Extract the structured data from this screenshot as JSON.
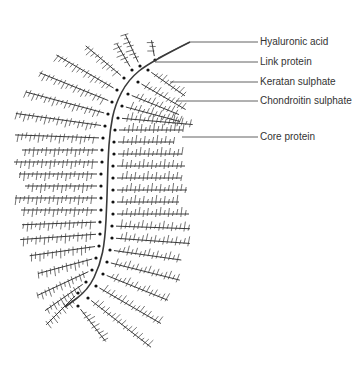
{
  "diagram": {
    "colors": {
      "ink": "#3a3a3a",
      "label": "#333333",
      "background": "#ffffff"
    },
    "labels": [
      {
        "id": "hyaluronic-acid",
        "text": "Hyaluronic acid",
        "x": 260,
        "y": 36,
        "line": [
          [
            158,
            58
          ],
          [
            190,
            42
          ],
          [
            258,
            42
          ]
        ]
      },
      {
        "id": "link-protein",
        "text": "Link protein",
        "x": 260,
        "y": 56,
        "line": [
          [
            155,
            62
          ],
          [
            258,
            62
          ]
        ]
      },
      {
        "id": "keratan-sulphate",
        "text": "Keratan sulphate",
        "x": 260,
        "y": 76,
        "line": [
          [
            170,
            82
          ],
          [
            258,
            82
          ]
        ]
      },
      {
        "id": "chondroitin-sulphate",
        "text": "Chondroitin sulphate",
        "x": 260,
        "y": 95,
        "line": [
          [
            176,
            101
          ],
          [
            258,
            101
          ]
        ]
      },
      {
        "id": "core-protein",
        "text": "Core protein",
        "x": 260,
        "y": 131,
        "line": [
          [
            182,
            137
          ],
          [
            258,
            137
          ]
        ]
      }
    ],
    "spine": [
      [
        190,
        42
      ],
      [
        150,
        62
      ],
      [
        128,
        80
      ],
      [
        115,
        105
      ],
      [
        110,
        130
      ],
      [
        108,
        160
      ],
      [
        107,
        200
      ],
      [
        105,
        240
      ],
      [
        100,
        265
      ],
      [
        88,
        290
      ],
      [
        65,
        307
      ]
    ],
    "left_chains": [
      {
        "start": [
          132,
          70
        ],
        "angle": -120,
        "length": 30
      },
      {
        "start": [
          124,
          78
        ],
        "angle": -140,
        "length": 50
      },
      {
        "start": [
          117,
          90
        ],
        "angle": -150,
        "length": 70
      },
      {
        "start": [
          112,
          102
        ],
        "angle": -158,
        "length": 78
      },
      {
        "start": [
          108,
          114
        ],
        "angle": -165,
        "length": 85
      },
      {
        "start": [
          105,
          126
        ],
        "angle": -172,
        "length": 90
      },
      {
        "start": [
          103,
          138
        ],
        "angle": -178,
        "length": 88
      },
      {
        "start": [
          102,
          150
        ],
        "angle": 180,
        "length": 80
      },
      {
        "start": [
          102,
          162
        ],
        "angle": 180,
        "length": 88
      },
      {
        "start": [
          101,
          174
        ],
        "angle": 180,
        "length": 82
      },
      {
        "start": [
          101,
          186
        ],
        "angle": 180,
        "length": 76
      },
      {
        "start": [
          101,
          198
        ],
        "angle": 180,
        "length": 86
      },
      {
        "start": [
          101,
          210
        ],
        "angle": 180,
        "length": 80
      },
      {
        "start": [
          100,
          222
        ],
        "angle": 178,
        "length": 78
      },
      {
        "start": [
          100,
          234
        ],
        "angle": 176,
        "length": 80
      },
      {
        "start": [
          99,
          246
        ],
        "angle": 172,
        "length": 70
      },
      {
        "start": [
          96,
          258
        ],
        "angle": 165,
        "length": 60
      },
      {
        "start": [
          92,
          270
        ],
        "angle": 155,
        "length": 60
      },
      {
        "start": [
          86,
          282
        ],
        "angle": 145,
        "length": 50
      },
      {
        "start": [
          78,
          293
        ],
        "angle": 135,
        "length": 45
      }
    ],
    "right_chains": [
      {
        "start": [
          148,
          70
        ],
        "angle": 35,
        "length": 45
      },
      {
        "start": [
          138,
          82
        ],
        "angle": 30,
        "length": 55
      },
      {
        "start": [
          128,
          94
        ],
        "angle": 22,
        "length": 55
      },
      {
        "start": [
          122,
          106
        ],
        "angle": 15,
        "length": 60
      },
      {
        "start": [
          118,
          118
        ],
        "angle": 5,
        "length": 75
      },
      {
        "start": [
          115,
          130
        ],
        "angle": 0,
        "length": 68
      },
      {
        "start": [
          114,
          142
        ],
        "angle": 0,
        "length": 60
      },
      {
        "start": [
          114,
          154
        ],
        "angle": 0,
        "length": 68
      },
      {
        "start": [
          113,
          166
        ],
        "angle": 0,
        "length": 72
      },
      {
        "start": [
          113,
          178
        ],
        "angle": 0,
        "length": 68
      },
      {
        "start": [
          113,
          190
        ],
        "angle": 0,
        "length": 74
      },
      {
        "start": [
          113,
          202
        ],
        "angle": 0,
        "length": 66
      },
      {
        "start": [
          113,
          214
        ],
        "angle": 0,
        "length": 76
      },
      {
        "start": [
          112,
          226
        ],
        "angle": 2,
        "length": 78
      },
      {
        "start": [
          112,
          238
        ],
        "angle": 4,
        "length": 78
      },
      {
        "start": [
          110,
          250
        ],
        "angle": 8,
        "length": 72
      },
      {
        "start": [
          107,
          262
        ],
        "angle": 14,
        "length": 75
      },
      {
        "start": [
          103,
          274
        ],
        "angle": 22,
        "length": 70
      },
      {
        "start": [
          96,
          286
        ],
        "angle": 30,
        "length": 75
      },
      {
        "start": [
          88,
          298
        ],
        "angle": 38,
        "length": 80
      },
      {
        "start": [
          78,
          306
        ],
        "angle": 52,
        "length": 45
      }
    ],
    "top_chains": [
      {
        "start": [
          140,
          66
        ],
        "angle": -115,
        "length": 35
      },
      {
        "start": [
          155,
          60
        ],
        "angle": -100,
        "length": 20
      }
    ]
  }
}
